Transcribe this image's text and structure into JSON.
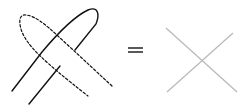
{
  "diagram": {
    "left_figure": {
      "solid_strand_color": "#111111",
      "dashed_strand_color": "#111111"
    },
    "operator": "=",
    "right_figure": {
      "line_color": "#b8b8b8",
      "shape": "X crossing"
    },
    "background": "#ffffff"
  }
}
